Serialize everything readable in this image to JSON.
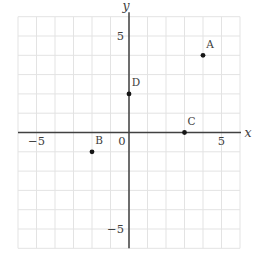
{
  "figure": {
    "background": "#ffffff",
    "grid_color": "#e3e3e3",
    "axis_color": "#414141",
    "point_color": "#161616",
    "text_color": "#3d3d3d",
    "width": 269,
    "height": 265
  },
  "chart_data": {
    "type": "scatter",
    "xlabel": "x",
    "ylabel": "y",
    "xlim": [
      -6,
      6
    ],
    "ylim": [
      -6,
      6
    ],
    "grid": true,
    "legend": false,
    "x_ticks": [
      {
        "value": -5,
        "label": "−5"
      },
      {
        "value": 5,
        "label": "5"
      }
    ],
    "y_ticks": [
      {
        "value": 5,
        "label": "5"
      },
      {
        "value": -5,
        "label": "−5"
      }
    ],
    "origin_label": "0",
    "points": [
      {
        "label": "A",
        "x": 4,
        "y": 4
      },
      {
        "label": "B",
        "x": -2,
        "y": -1
      },
      {
        "label": "C",
        "x": 3,
        "y": 0
      },
      {
        "label": "D",
        "x": 0,
        "y": 2
      }
    ]
  }
}
